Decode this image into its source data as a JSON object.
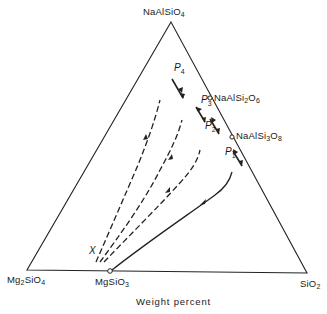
{
  "diagram": {
    "type": "ternary-phase-diagram",
    "vertices": {
      "top": {
        "base": "NaAlSiO",
        "sub": "4"
      },
      "bottom_left": {
        "base1": "Mg",
        "sub1": "2",
        "base2": "SiO",
        "sub2": "4"
      },
      "bottom_right": {
        "base": "SiO",
        "sub": "2"
      }
    },
    "points": {
      "mgsio3": {
        "base": "MgSiO",
        "sub": "3"
      },
      "jadeite": {
        "base1": "NaAlSi",
        "sub1": "2",
        "base2": "O",
        "sub2": "6"
      },
      "albite": {
        "base1": "NaAlSi",
        "sub1": "3",
        "base2": "O",
        "sub2": "8"
      }
    },
    "x_label": "X",
    "pressure_labels": [
      {
        "letter": "P",
        "sub": "1"
      },
      {
        "letter": "P",
        "sub": "2"
      },
      {
        "letter": "P",
        "sub": "3"
      },
      {
        "letter": "P",
        "sub": "4"
      }
    ],
    "axis_caption": "Weight percent",
    "curves": [
      {
        "name": "P1",
        "style": "solid"
      },
      {
        "name": "P2",
        "style": "dashed"
      },
      {
        "name": "P3",
        "style": "dashed"
      },
      {
        "name": "P4",
        "style": "dashed"
      }
    ]
  }
}
